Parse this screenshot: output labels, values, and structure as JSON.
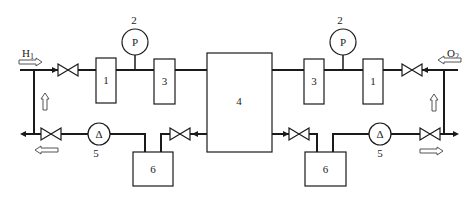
{
  "diagram": {
    "type": "process-flow-schematic",
    "inlets": {
      "left_gas": "H",
      "left_gas_sub": "1",
      "right_gas": "O",
      "right_gas_sub": "2"
    },
    "components": {
      "box_1_left": "1",
      "box_1_right": "1",
      "gauge_left_symbol": "P",
      "gauge_left_label": "2",
      "gauge_right_symbol": "P",
      "gauge_right_label": "2",
      "box_3_left": "3",
      "box_3_right": "3",
      "central_unit": "4",
      "flowmeter_left_symbol": "Δ",
      "flowmeter_left_label": "5",
      "flowmeter_right_symbol": "Δ",
      "flowmeter_right_label": "5",
      "tank_left": "6",
      "tank_right": "6"
    },
    "colors": {
      "line": "#1a1a1a",
      "background": "#ffffff",
      "flow_arrow_outline": "#555555"
    }
  }
}
